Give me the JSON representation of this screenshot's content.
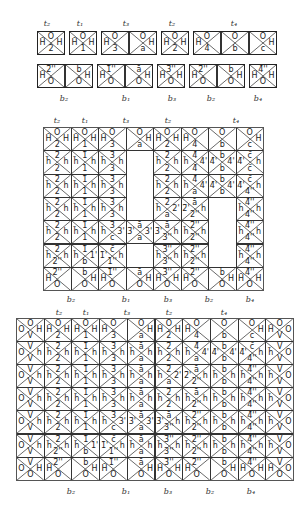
{
  "top_set": {
    "top_labels": [
      {
        "text": "t₂",
        "x": 47
      },
      {
        "text": "t₁",
        "x": 80
      },
      {
        "text": "t₃",
        "x": 126
      },
      {
        "text": "t₂",
        "x": 172
      },
      {
        "text": "t₄",
        "x": 234
      }
    ],
    "bottom_labels": [
      {
        "text": "b₂",
        "x": 64
      },
      {
        "text": "b₁",
        "x": 126
      },
      {
        "text": "b₃",
        "x": 172
      },
      {
        "text": "b₂",
        "x": 211
      },
      {
        "text": "b₄",
        "x": 258
      }
    ],
    "row1": [
      {
        "group": "t2",
        "tiles": [
          [
            "O",
            "H̄",
            "H",
            "2"
          ]
        ]
      },
      {
        "group": "t1",
        "tiles": [
          [
            "O",
            "H̄",
            "H",
            "1"
          ]
        ]
      },
      {
        "group": "t3",
        "tiles": [
          [
            "O",
            "H̄",
            "",
            "3"
          ],
          [
            "O",
            "",
            "H",
            "a"
          ]
        ]
      },
      {
        "group": "t2",
        "tiles": [
          [
            "O",
            "H̄",
            "H",
            "2"
          ]
        ]
      },
      {
        "group": "t4",
        "tiles": [
          [
            "O",
            "H̄",
            "",
            "4"
          ],
          [
            "O",
            "",
            "",
            "b"
          ],
          [
            "O",
            "",
            "H",
            "c"
          ]
        ]
      }
    ],
    "row2": [
      {
        "group": "b2",
        "tiles": [
          [
            "2̄''",
            "H̄",
            "",
            "O"
          ],
          [
            "b̄",
            "",
            "H",
            "O"
          ]
        ]
      },
      {
        "group": "b1",
        "tiles": [
          [
            "1̄''",
            "H̄",
            "",
            "O"
          ],
          [
            "ā",
            "",
            "H",
            "O"
          ]
        ]
      },
      {
        "group": "b3",
        "tiles": [
          [
            "3̄''",
            "H̄",
            "H",
            "O"
          ]
        ]
      },
      {
        "group": "b2",
        "tiles": [
          [
            "2̄''",
            "H̄",
            "",
            "O"
          ],
          [
            "b̄",
            "",
            "H",
            "O"
          ]
        ]
      },
      {
        "group": "b4",
        "tiles": [
          [
            "4̄''",
            "H̄",
            "H",
            "O"
          ]
        ]
      }
    ]
  },
  "middle_grid": {
    "top_labels": [
      {
        "text": "t₂",
        "x": 57
      },
      {
        "text": "t₁",
        "x": 85
      },
      {
        "text": "t₃",
        "x": 126
      },
      {
        "text": "t₂",
        "x": 168
      },
      {
        "text": "t₄",
        "x": 236
      }
    ],
    "bottom_labels": [
      {
        "text": "b₂",
        "x": 71
      },
      {
        "text": "b₁",
        "x": 126
      },
      {
        "text": "b₃",
        "x": 168
      },
      {
        "text": "b₂",
        "x": 209
      },
      {
        "text": "b₄",
        "x": 250
      }
    ],
    "rows": [
      [
        [
          "O",
          "H̄",
          "H",
          "2"
        ],
        [
          "O",
          "H̄",
          "H",
          "1"
        ],
        [
          "O",
          "H̄",
          "",
          "3"
        ],
        [
          "O",
          "",
          "H",
          "a"
        ],
        [
          "O",
          "H̄",
          "H",
          "2"
        ],
        [
          "O",
          "H̄",
          "",
          "4"
        ],
        [
          "O",
          "",
          "",
          "b"
        ],
        [
          "O",
          "",
          "H",
          "c"
        ]
      ],
      [
        [
          "2̄",
          "h̄",
          "h",
          "2"
        ],
        [
          "1̄",
          "h̄",
          "h",
          "1"
        ],
        [
          "3̄",
          "h̄",
          "h",
          "3"
        ],
        null,
        [
          "2̄",
          "h̄",
          "h",
          "2"
        ],
        [
          "4̄",
          "h̄",
          "4'",
          "4̄"
        ],
        [
          "b̄",
          "4̄'",
          "4'",
          "b"
        ],
        [
          "c̄",
          "4̄'",
          "h",
          "c̄"
        ]
      ],
      [
        [
          "2̄",
          "h̄",
          "h",
          "2"
        ],
        [
          "1̄",
          "h̄",
          "h",
          "1"
        ],
        [
          "3̄",
          "h̄",
          "h",
          "3"
        ],
        null,
        [
          "2̄",
          "h̄",
          "h",
          "2"
        ],
        [
          "4̄",
          "h̄",
          "4'",
          "a"
        ],
        [
          "b̄",
          "4̄'",
          "4'",
          "b"
        ],
        [
          "c̄",
          "4̄'",
          "h",
          "4''"
        ]
      ],
      [
        [
          "2̄",
          "h̄",
          "h",
          "2"
        ],
        [
          "1̄",
          "h̄",
          "h",
          "1"
        ],
        [
          "3̄",
          "h̄",
          "h",
          "3"
        ],
        null,
        [
          "2̄",
          "h̄",
          "2'",
          "a"
        ],
        [
          "ā",
          "2̄'",
          "h",
          "2''"
        ],
        null,
        [
          "4̄''",
          "h̄",
          "h",
          "4''"
        ]
      ],
      [
        [
          "2̄",
          "h̄",
          "h",
          "2"
        ],
        [
          "1̄",
          "h̄",
          "h",
          "1"
        ],
        [
          "3̄",
          "h̄",
          "3'",
          "c"
        ],
        [
          "ā",
          "3̄'",
          "3'",
          "a"
        ],
        [
          "ā",
          "3̄'",
          "h",
          "3''"
        ],
        [
          "2̄''",
          "h̄",
          "h",
          "2''"
        ],
        null,
        [
          "4̄''",
          "h̄",
          "h",
          "4''"
        ]
      ],
      [
        [
          "2̄",
          "h̄",
          "h",
          "2''"
        ],
        [
          "1̄",
          "h̄",
          "1'",
          "b"
        ],
        [
          "c̄",
          "1̄'",
          "h",
          "1''"
        ],
        null,
        [
          "3̄''",
          "h̄",
          "h",
          "3''"
        ],
        [
          "2̄''",
          "h̄",
          "h",
          "2''"
        ],
        null,
        [
          "4̄''",
          "h̄",
          "h",
          "4''"
        ]
      ],
      [
        [
          "2̄''",
          "H̄",
          "",
          "O"
        ],
        [
          "b̄",
          "",
          "H",
          "O"
        ],
        [
          "1̄''",
          "H̄",
          "",
          "O"
        ],
        [
          "ā",
          "",
          "H",
          "O"
        ],
        [
          "3̄''",
          "H̄",
          "H",
          "O"
        ],
        [
          "2̄''",
          "H̄",
          "",
          "O"
        ],
        [
          "b̄",
          "",
          "H",
          "O"
        ],
        [
          "4̄''",
          "H̄",
          "H",
          "O"
        ]
      ]
    ]
  },
  "bottom_grid": {
    "top_labels": [
      {
        "text": "t₂",
        "x": 59
      },
      {
        "text": "t₁",
        "x": 86
      },
      {
        "text": "t₃",
        "x": 127
      },
      {
        "text": "t₂",
        "x": 169
      },
      {
        "text": "t₄",
        "x": 224
      }
    ],
    "bottom_labels": [
      {
        "text": "b₂",
        "x": 71
      },
      {
        "text": "b₁",
        "x": 126
      },
      {
        "text": "b₃",
        "x": 168
      },
      {
        "text": "b₂",
        "x": 210
      },
      {
        "text": "b₄",
        "x": 251
      }
    ],
    "rows": [
      [
        [
          "O",
          "O",
          "H",
          "V"
        ],
        [
          "O",
          "H̄",
          "H",
          "2"
        ],
        [
          "O",
          "H̄",
          "H",
          "1"
        ],
        [
          "O",
          "H̄",
          "",
          "3"
        ],
        [
          "O",
          "",
          "H",
          "a"
        ],
        [
          "O",
          "H̄",
          "H",
          "2"
        ],
        [
          "O",
          "H̄",
          "",
          "4"
        ],
        [
          "O",
          "",
          "",
          "b"
        ],
        [
          "O",
          "",
          "H",
          "c"
        ],
        [
          "O",
          "H̄",
          "O",
          "V"
        ]
      ],
      [
        [
          "V̄",
          "O",
          "h",
          "V"
        ],
        [
          "2̄",
          "h̄",
          "h",
          "2"
        ],
        [
          "1̄",
          "h̄",
          "h",
          "1"
        ],
        [
          "3̄",
          "h̄",
          "h",
          "3"
        ],
        [
          "ā",
          "h̄",
          "h",
          "a"
        ],
        [
          "2̄",
          "h̄",
          "h",
          "2"
        ],
        [
          "4̄",
          "h̄",
          "4'",
          "a"
        ],
        [
          "b̄",
          "4̄'",
          "4'",
          "b"
        ],
        [
          "c̄",
          "4̄'",
          "h",
          "4''"
        ],
        [
          "V̄",
          "h̄",
          "O",
          "V"
        ]
      ],
      [
        [
          "V̄",
          "O",
          "h",
          "V"
        ],
        [
          "2̄",
          "h̄",
          "h",
          "2"
        ],
        [
          "1̄",
          "h̄",
          "h",
          "1"
        ],
        [
          "3̄",
          "h̄",
          "h",
          "3"
        ],
        [
          "ā",
          "h̄",
          "h",
          "a"
        ],
        [
          "2̄",
          "h̄",
          "2'",
          "a"
        ],
        [
          "ā",
          "2̄'",
          "h",
          "2''"
        ],
        [
          "b̄",
          "h̄",
          "h",
          "b"
        ],
        [
          "4̄''",
          "h̄",
          "h",
          "4''"
        ],
        [
          "V̄",
          "h̄",
          "O",
          "V"
        ]
      ],
      [
        [
          "V̄",
          "O",
          "h",
          "V"
        ],
        [
          "2̄",
          "h̄",
          "h",
          "2"
        ],
        [
          "1̄",
          "h̄",
          "h",
          "1"
        ],
        [
          "3̄",
          "h̄",
          "h",
          "3"
        ],
        [
          "ā",
          "h̄",
          "h",
          "a"
        ],
        [
          "2̄",
          "h̄",
          "h",
          "2"
        ],
        [
          "ā",
          "h̄",
          "h",
          "2''"
        ],
        [
          "b̄",
          "h̄",
          "h",
          "b"
        ],
        [
          "4̄''",
          "h̄",
          "h",
          "4''"
        ],
        [
          "V̄",
          "h̄",
          "O",
          "V"
        ]
      ],
      [
        [
          "V̄",
          "O",
          "h",
          "V"
        ],
        [
          "2̄",
          "h̄",
          "h",
          "2"
        ],
        [
          "1̄",
          "h̄",
          "h",
          "1"
        ],
        [
          "3̄",
          "h̄",
          "3'",
          "c"
        ],
        [
          "ā",
          "3̄'",
          "3'",
          "a"
        ],
        [
          "ā",
          "3̄'",
          "h",
          "3''"
        ],
        [
          "2̄''",
          "h̄",
          "h",
          "2''"
        ],
        [
          "b̄",
          "h̄",
          "h",
          "b"
        ],
        [
          "4̄''",
          "h̄",
          "h",
          "4''"
        ],
        [
          "V̄",
          "h̄",
          "O",
          "V"
        ]
      ],
      [
        [
          "V̄",
          "O",
          "h",
          "V"
        ],
        [
          "2̄",
          "h̄",
          "h",
          "2''"
        ],
        [
          "1̄",
          "h̄",
          "1'",
          "b"
        ],
        [
          "c̄",
          "1̄'",
          "h",
          "1''"
        ],
        [
          "ā",
          "h̄",
          "h",
          "a"
        ],
        [
          "3̄''",
          "h̄",
          "h",
          "3''"
        ],
        [
          "2̄''",
          "h̄",
          "h",
          "2''"
        ],
        [
          "b̄",
          "h̄",
          "h",
          "b"
        ],
        [
          "4̄''",
          "h̄",
          "h",
          "4''"
        ],
        [
          "V̄",
          "h̄",
          "O",
          "V"
        ]
      ],
      [
        [
          "V̄",
          "O",
          "H",
          "O"
        ],
        [
          "2̄''",
          "H̄",
          "",
          "O"
        ],
        [
          "b̄",
          "",
          "H",
          "O"
        ],
        [
          "1̄''",
          "H̄",
          "",
          "O"
        ],
        [
          "ā",
          "",
          "H",
          "O"
        ],
        [
          "3̄''",
          "H̄",
          "H",
          "O"
        ],
        [
          "2̄''",
          "H̄",
          "",
          "O"
        ],
        [
          "b̄",
          "",
          "H",
          "O"
        ],
        [
          "4̄''",
          "H̄",
          "H",
          "O"
        ],
        [
          "V̄",
          "H̄",
          "O",
          "O"
        ]
      ]
    ]
  }
}
